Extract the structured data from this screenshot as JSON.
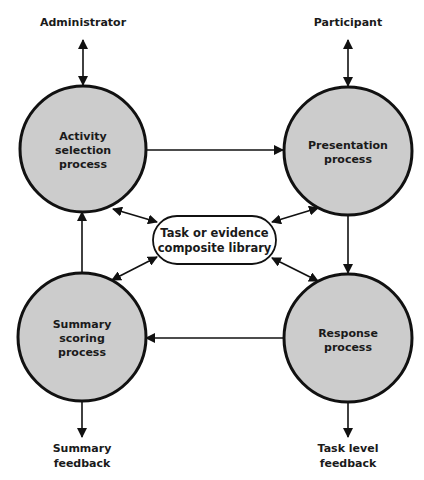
{
  "diagram": {
    "colors": {
      "background": "#ffffff",
      "process_fill": "#cccccc",
      "stroke": "#111111",
      "text": "#1a1a1a"
    },
    "external": {
      "administrator": "Administrator",
      "participant": "Participant",
      "summary_feedback": [
        "Summary",
        "feedback"
      ],
      "task_feedback": [
        "Task level",
        "feedback"
      ]
    },
    "processes": {
      "activity_selection": [
        "Activity",
        "selection",
        "process"
      ],
      "presentation": [
        "Presentation",
        "process"
      ],
      "summary_scoring": [
        "Summary",
        "scoring",
        "process"
      ],
      "response": [
        "Response",
        "process"
      ]
    },
    "library": [
      "Task or evidence",
      "composite library"
    ],
    "edges": [
      {
        "from": "Administrator",
        "to": "Activity selection process",
        "type": "bidirectional"
      },
      {
        "from": "Participant",
        "to": "Presentation process",
        "type": "bidirectional"
      },
      {
        "from": "Activity selection process",
        "to": "Presentation process",
        "type": "directed"
      },
      {
        "from": "Presentation process",
        "to": "Response process",
        "type": "directed"
      },
      {
        "from": "Response process",
        "to": "Summary scoring process",
        "type": "directed"
      },
      {
        "from": "Summary scoring process",
        "to": "Activity selection process",
        "type": "directed"
      },
      {
        "from": "Summary scoring process",
        "to": "Summary feedback",
        "type": "directed"
      },
      {
        "from": "Response process",
        "to": "Task level feedback",
        "type": "directed"
      },
      {
        "from": "Activity selection process",
        "to": "Task or evidence composite library",
        "type": "bidirectional"
      },
      {
        "from": "Presentation process",
        "to": "Task or evidence composite library",
        "type": "bidirectional"
      },
      {
        "from": "Summary scoring process",
        "to": "Task or evidence composite library",
        "type": "bidirectional"
      },
      {
        "from": "Response process",
        "to": "Task or evidence composite library",
        "type": "bidirectional"
      }
    ]
  }
}
